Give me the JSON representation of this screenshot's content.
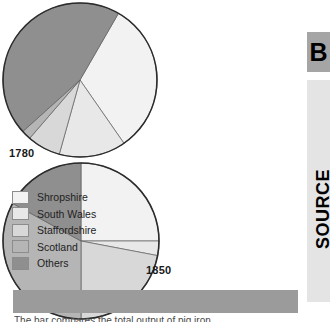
{
  "source_rail": {
    "letter": "B",
    "word": "SOURCE"
  },
  "legend": {
    "items": [
      {
        "label": "Shropshire",
        "color": "#f2f2f2"
      },
      {
        "label": "South Wales",
        "color": "#e8e8e8"
      },
      {
        "label": "Staffordshire",
        "color": "#d8d8d8"
      },
      {
        "label": "Scotland",
        "color": "#b5b5b5"
      },
      {
        "label": "Others",
        "color": "#8f8f8f"
      }
    ]
  },
  "bottom_caption": "The bar compares the total output of pig iron",
  "chart_data": [
    {
      "type": "pie",
      "title": "1780",
      "categories": [
        "Shropshire",
        "South Wales",
        "Staffordshire",
        "Scotland",
        "Others"
      ],
      "values": [
        32,
        14,
        7,
        2,
        45
      ],
      "colors": [
        "#f2f2f2",
        "#e8e8e8",
        "#d8d8d8",
        "#b5b5b5",
        "#8f8f8f"
      ],
      "start_angle": -60,
      "center": [
        94,
        82
      ],
      "radius": 77,
      "legend_position": "left",
      "xlabel": "",
      "ylabel": ""
    },
    {
      "type": "pie",
      "title": "1850",
      "categories": [
        "Shropshire",
        "South Wales",
        "Staffordshire",
        "Scotland",
        "Others"
      ],
      "values": [
        25,
        3,
        22,
        33,
        17
      ],
      "colors": [
        "#f2f2f2",
        "#e8e8e8",
        "#d8d8d8",
        "#b5b5b5",
        "#8f8f8f"
      ],
      "start_angle": -90,
      "center": [
        228,
        203
      ],
      "radius": 78,
      "legend_position": "left",
      "xlabel": "",
      "ylabel": ""
    }
  ]
}
